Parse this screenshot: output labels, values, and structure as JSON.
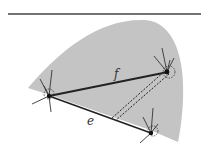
{
  "diagram": {
    "colors": {
      "region_fill": "#c4c4c4",
      "edge": "#222222",
      "rule": "#444444",
      "background": "#ffffff"
    },
    "edges": [
      {
        "id": "f",
        "label": "f",
        "from": "v_left",
        "to": "v_right",
        "style": "solid"
      },
      {
        "id": "e",
        "label": "e",
        "from": "v_left",
        "to": "v_bottom",
        "style": "solid"
      },
      {
        "id": "d",
        "label": "",
        "from": "v_right",
        "to": "point_on_e",
        "style": "double-dashed"
      }
    ],
    "vertices": [
      {
        "id": "v_left",
        "highlight": "dashed-circle"
      },
      {
        "id": "v_right",
        "highlight": "dashed-circle"
      },
      {
        "id": "v_bottom",
        "highlight": "dashed-circle"
      }
    ],
    "labels": {
      "f": "f",
      "e": "e"
    }
  }
}
